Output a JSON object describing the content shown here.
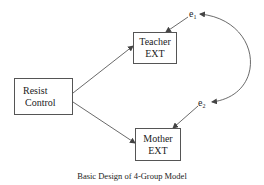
{
  "diagram": {
    "nodes": {
      "resist_control": {
        "line1": "Resist",
        "line2": "Control"
      },
      "teacher_ext": {
        "line1": "Teacher",
        "line2": "EXT"
      },
      "mother_ext": {
        "line1": "Mother",
        "line2": "EXT"
      }
    },
    "errors": {
      "e1": {
        "base": "e",
        "sub": "1"
      },
      "e2": {
        "base": "e",
        "sub": "2"
      }
    },
    "edges": [
      {
        "from": "Resist Control",
        "to": "Teacher EXT",
        "type": "directed"
      },
      {
        "from": "Resist Control",
        "to": "Mother EXT",
        "type": "directed"
      },
      {
        "from": "e1",
        "to": "Teacher EXT",
        "type": "directed"
      },
      {
        "from": "e2",
        "to": "Mother EXT",
        "type": "directed"
      },
      {
        "from": "e1",
        "to": "e2",
        "type": "bidirectional-curved"
      }
    ],
    "caption": "Basic Design of 4-Group Model",
    "line_color": "#444444"
  }
}
